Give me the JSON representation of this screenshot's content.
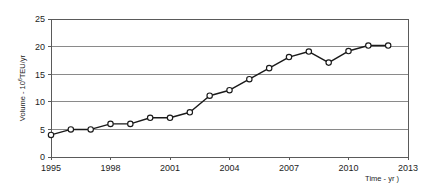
{
  "chart_data": {
    "type": "line",
    "title": "",
    "subtitle": "",
    "xlabel": "Time - yr )",
    "ylabel": "Volume - 10⁶TEU/yr",
    "ylabel_parts": {
      "prefix": "Volume - 10",
      "exponent": "6",
      "suffix": "TEU/yr"
    },
    "x": [
      1995,
      1996,
      1997,
      1998,
      1999,
      2000,
      2001,
      2002,
      2003,
      2004,
      2005,
      2006,
      2007,
      2008,
      2009,
      2010,
      2011,
      2012
    ],
    "values": [
      4.0,
      5.0,
      5.0,
      6.0,
      6.0,
      7.1,
      7.1,
      8.1,
      11.1,
      12.1,
      14.1,
      16.1,
      18.1,
      19.1,
      17.1,
      19.2,
      20.2,
      20.2
    ],
    "series": [
      {
        "name": "Container volume",
        "values": [
          4.0,
          5.0,
          5.0,
          6.0,
          6.0,
          7.1,
          7.1,
          8.1,
          11.1,
          12.1,
          14.1,
          16.1,
          18.1,
          19.1,
          17.1,
          19.2,
          20.2,
          20.2
        ]
      }
    ],
    "xlim": [
      1995,
      2013
    ],
    "ylim": [
      0,
      25
    ],
    "xticks": [
      1995,
      1998,
      2001,
      2004,
      2007,
      2010,
      2013
    ],
    "xtick_labels": [
      "1995",
      "1998",
      "2001",
      "2004",
      "2007",
      "2010",
      "2013"
    ],
    "yticks": [
      0,
      5,
      10,
      15,
      20,
      25
    ],
    "ytick_labels": [
      "0",
      "5",
      "10",
      "15",
      "20",
      "25"
    ],
    "grid": "horizontal",
    "legend": "none",
    "marker": "open-circle",
    "line_color": "#1a1a1a",
    "marker_fill": "#ffffff",
    "grid_color": "#7d7d7d",
    "background": "#ffffff",
    "annotations": []
  }
}
